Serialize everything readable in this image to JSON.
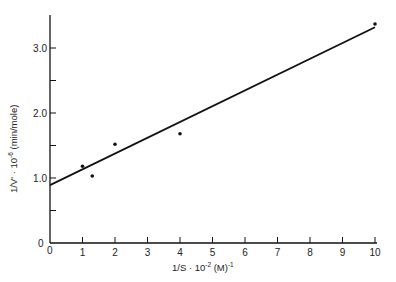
{
  "chart_data": {
    "type": "scatter",
    "title": "",
    "xlabel": "1/S · 10⁻² (M)⁻¹",
    "ylabel": "1/V' · 10⁻⁶ (min/mole)",
    "xlim": [
      0,
      10
    ],
    "ylim": [
      0,
      3.5
    ],
    "x_ticks": [
      0,
      1,
      2,
      3,
      4,
      5,
      6,
      7,
      8,
      9,
      10
    ],
    "x_tick_labels": [
      "0",
      "1",
      "2",
      "3",
      "4",
      "5",
      "6",
      "7",
      "8",
      "9",
      "10"
    ],
    "y_ticks": [
      0,
      0.5,
      1.0,
      1.5,
      2.0,
      2.5,
      3.0
    ],
    "y_tick_labels": [
      "0",
      "",
      "1.0",
      "",
      "2.0",
      "",
      "3.0"
    ],
    "grid": false,
    "legend": null,
    "series": [
      {
        "name": "data points",
        "x": [
          1.0,
          1.3,
          2.0,
          4.0,
          10.0
        ],
        "y": [
          1.18,
          1.03,
          1.52,
          1.68,
          3.37
        ]
      }
    ],
    "fit_line": {
      "name": "linear fit",
      "x": [
        0,
        10
      ],
      "y": [
        0.89,
        3.32
      ]
    }
  },
  "labels": {
    "xlabel_main": "1/S · 10",
    "xlabel_exp": "-2",
    "xlabel_unit": " (M)",
    "xlabel_unit_exp": "-1",
    "ylabel_main": "1/V' · 10",
    "ylabel_exp": "-6",
    "ylabel_unit": " (min/mole)",
    "origin_y": "0",
    "origin_x": "0"
  }
}
